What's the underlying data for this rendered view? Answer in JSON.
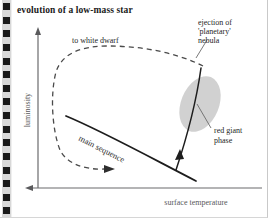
{
  "page": {
    "title": "evolution of a low-mass star",
    "background_color": "#ffffff",
    "binding_color": "#1a1a1a",
    "binding_strip_color": "#d8d8d8",
    "binding_hole_count": 16
  },
  "chart_data": {
    "type": "line",
    "title": "evolution of a low-mass star",
    "xlabel": "surface temperature",
    "ylabel": "luminosity",
    "grid": false,
    "legend": null,
    "axes": {
      "x_direction": "decreasing to the right (arrow points left)",
      "y_direction": "increasing upward",
      "x_ticks": [],
      "y_ticks": []
    },
    "series": [
      {
        "name": "main sequence",
        "style": "solid",
        "label": "main sequence",
        "description": "solid diagonal track sloping down to the right"
      },
      {
        "name": "red giant branch",
        "style": "solid",
        "label": "red giant phase",
        "description": "solid track rising steeply from the main sequence toward high luminosity, with arrow showing direction of evolution"
      },
      {
        "name": "post-red-giant loop",
        "style": "dashed",
        "label": "to white dwarf",
        "description": "dashed loop from the tip of the red giant branch across the top to the left, then down and back to the right toward the white dwarf region"
      }
    ],
    "annotations": [
      {
        "id": "to-white-dwarf",
        "text": "to white dwarf"
      },
      {
        "id": "ejection",
        "text_lines": [
          "ejection of",
          "'planetary'",
          "nebula"
        ]
      },
      {
        "id": "red-giant",
        "text_lines": [
          "red giant",
          "phase"
        ]
      },
      {
        "id": "main-sequence",
        "text": "main sequence"
      }
    ],
    "shapes": [
      {
        "id": "red-giant-region",
        "type": "ellipse",
        "fill": "#c8c8c8",
        "description": "shaded tilted ellipse marking the red giant phase region"
      }
    ]
  },
  "labels": {
    "y_axis": "luminosity",
    "x_axis": "surface temperature",
    "to_white_dwarf": "to white dwarf",
    "ejection_line1": "ejection of",
    "ejection_line2": "'planetary'",
    "ejection_line3": "nebula",
    "red_giant_line1": "red giant",
    "red_giant_line2": "phase",
    "main_sequence": "main sequence"
  }
}
